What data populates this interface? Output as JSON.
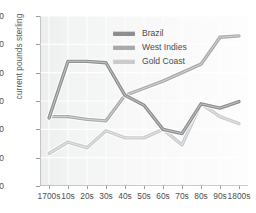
{
  "chart_data": {
    "type": "line",
    "title": "",
    "subtitle": "",
    "xlabel": "",
    "ylabel": "current pounds sterling",
    "categories": [
      "1700s",
      "10s",
      "20s",
      "30s",
      "40s",
      "50s",
      "60s",
      "70s",
      "80s",
      "90s",
      "1800s"
    ],
    "ylim": [
      0,
      60
    ],
    "yticks": [
      0,
      10,
      20,
      30,
      40,
      50,
      60
    ],
    "grid": true,
    "legend_position": "top-center",
    "series": [
      {
        "name": "Brazil",
        "color": "#8c8e90",
        "values": [
          24.0,
          44.0,
          44.0,
          43.5,
          32.0,
          28.5,
          20.0,
          18.5,
          29.0,
          27.5,
          29.8
        ]
      },
      {
        "name": "West Indies",
        "color": "#a8aaac",
        "values": [
          24.5,
          24.5,
          23.5,
          23.0,
          32.0,
          34.5,
          37.0,
          40.0,
          43.0,
          52.5,
          53.0
        ]
      },
      {
        "name": "Gold Coast",
        "color": "#c9cbcd",
        "values": [
          11.5,
          15.5,
          13.5,
          19.5,
          17.0,
          17.0,
          20.0,
          14.5,
          29.0,
          24.5,
          22.0
        ]
      }
    ]
  },
  "legend": {
    "items": [
      {
        "label": "Brazil",
        "color": "#8c8e90"
      },
      {
        "label": "West Indies",
        "color": "#a8aaac"
      },
      {
        "label": "Gold Coast",
        "color": "#c9cbcd"
      }
    ]
  },
  "axes": {
    "y_title": "current pounds sterling"
  }
}
